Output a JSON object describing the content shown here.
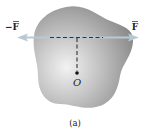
{
  "diagram": {
    "caption": "(a)",
    "forces": {
      "left_label": "−F",
      "right_label": "F"
    },
    "point_label": "O",
    "colors": {
      "body_light": "#e6e6e6",
      "body_dark": "#8a8a8a",
      "arrow": "#b9c9d4",
      "dashed": "#333333",
      "text": "#222222"
    }
  }
}
